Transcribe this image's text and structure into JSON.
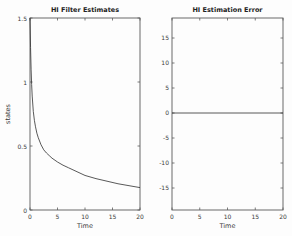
{
  "figure": {
    "background": "#fdfdfd",
    "axes_color": "#5a5a5a",
    "curve_color": "#2f2f2f",
    "text_color": "#3a3a3a"
  },
  "chart_data": [
    {
      "type": "line",
      "title": "HI Filter Estimates",
      "xlabel": "Time",
      "ylabel": "states",
      "xlim": [
        0,
        20
      ],
      "ylim": [
        0,
        1.5
      ],
      "xticks": [
        0,
        5,
        10,
        15,
        20
      ],
      "xtick_labels": [
        "0",
        "5",
        "10",
        "15",
        "20"
      ],
      "yticks": [
        1.5,
        1,
        0.5,
        0
      ],
      "ytick_labels": [
        "1.5",
        "1",
        "0.5",
        "0"
      ],
      "grid": false,
      "legend": null,
      "series": [
        {
          "name": "filter-estimate-curve",
          "x": [
            0,
            0.1,
            0.2,
            0.3,
            0.4,
            0.6,
            0.8,
            1,
            1.25,
            1.5,
            2,
            2.5,
            3,
            3.5,
            4,
            5,
            6,
            7,
            8,
            10,
            12,
            14,
            16,
            18,
            20
          ],
          "y": [
            1.5,
            1.27,
            1.1,
            0.98,
            0.89,
            0.77,
            0.7,
            0.65,
            0.6,
            0.565,
            0.51,
            0.47,
            0.445,
            0.425,
            0.405,
            0.375,
            0.35,
            0.33,
            0.31,
            0.27,
            0.245,
            0.225,
            0.205,
            0.19,
            0.175
          ]
        }
      ]
    },
    {
      "type": "line",
      "title": "HI Estimation Error",
      "xlabel": "Time",
      "ylabel": "",
      "xlim": [
        0,
        20
      ],
      "ylim": [
        -19.4,
        19
      ],
      "xticks": [
        0,
        5,
        10,
        15,
        20
      ],
      "xtick_labels": [
        "0",
        "5",
        "10",
        "15",
        "20"
      ],
      "yticks": [
        15,
        10,
        5,
        0,
        -5,
        -10,
        -15
      ],
      "ytick_labels": [
        "15",
        "10",
        "5",
        "0",
        "-5",
        "-10",
        "-15"
      ],
      "grid": false,
      "legend": null,
      "series": [
        {
          "name": "estimation-error-line",
          "x": [
            0,
            20
          ],
          "y": [
            0,
            0
          ]
        }
      ]
    }
  ]
}
